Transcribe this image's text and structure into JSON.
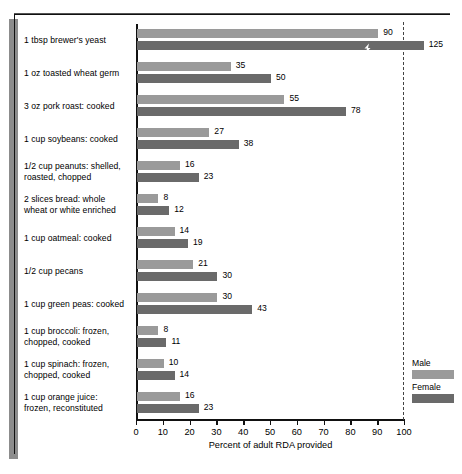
{
  "chart_data": {
    "type": "bar",
    "title": "",
    "xlabel": "Percent of adult RDA provided",
    "ylabel": "",
    "xlim": [
      0,
      100
    ],
    "xticks": [
      0,
      10,
      20,
      30,
      40,
      50,
      60,
      70,
      80,
      90,
      100
    ],
    "grid": false,
    "orientation": "horizontal",
    "legend_position": "bottom-right",
    "reference_line": {
      "value": 100,
      "style": "dashed"
    },
    "categories": [
      "1 tbsp brewer's yeast",
      "1 oz toasted wheat germ",
      "3 oz pork roast:  cooked",
      "1 cup soybeans:  cooked",
      "1/2 cup peanuts:  shelled,\nroasted, chopped",
      "2 slices bread:  whole\nwheat or white enriched",
      "1 cup oatmeal:  cooked",
      "1/2 cup pecans",
      "1 cup green peas:  cooked",
      "1 cup broccoli:  frozen,\nchopped, cooked",
      "1 cup spinach:  frozen,\nchopped, cooked",
      "1 cup orange juice:\nfrozen, reconstituted"
    ],
    "series": [
      {
        "name": "Male",
        "color": "#9a9a9a",
        "values": [
          90,
          35,
          55,
          27,
          16,
          8,
          14,
          21,
          30,
          8,
          10,
          16
        ]
      },
      {
        "name": "Female",
        "color": "#6a6a6a",
        "values": [
          125,
          50,
          78,
          38,
          23,
          12,
          19,
          30,
          43,
          11,
          14,
          23
        ],
        "broken_axis_indices": [
          0
        ]
      }
    ]
  },
  "legend": {
    "entries": [
      {
        "label": "Male",
        "color": "#9a9a9a"
      },
      {
        "label": "Female",
        "color": "#6a6a6a"
      }
    ]
  },
  "axis": {
    "tick_labels": [
      "0",
      "10",
      "20",
      "30",
      "40",
      "50",
      "60",
      "70",
      "80",
      "90",
      "100"
    ],
    "title": "Percent of adult RDA provided"
  }
}
